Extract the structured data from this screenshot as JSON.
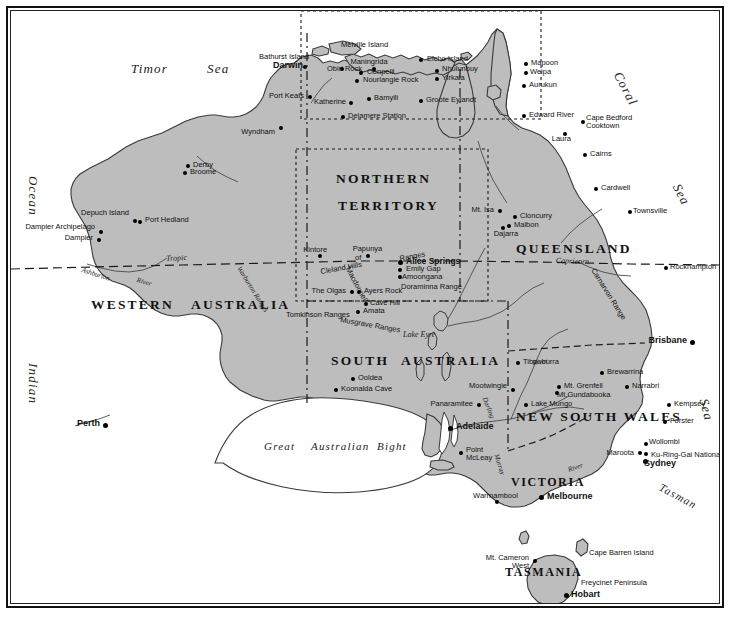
{
  "document": {
    "title": "Map of Australia",
    "caption": ""
  },
  "map": {
    "projection_note": "",
    "water_color": "#ffffff",
    "land_color": "#bdbdbd",
    "border_color": "#1a1a1a"
  },
  "oceans": [
    {
      "name": "Timor",
      "sub": "Sea"
    },
    {
      "name": "Indian",
      "sub": "Ocean"
    },
    {
      "name": "Coral",
      "sub": "Sea"
    },
    {
      "name": "Tasman",
      "sub": "Sea"
    }
  ],
  "ocean_labels": {
    "timor": "Timor",
    "timor_sea": "Sea",
    "ocean": "Ocean",
    "indian": "Indian",
    "coral": "Coral",
    "coral_sea": "Sea",
    "tasman": "Tasman",
    "tasman_sea": "Sea"
  },
  "states": {
    "northern": "NORTHERN",
    "territory": "TERRITORY",
    "queensland": "QUEENSLAND",
    "western": "WESTERN",
    "australia_w": "AUSTRALIA",
    "south": "SOUTH",
    "australia_s": "AUSTRALIA",
    "new_south_wales": "NEW  SOUTH  WALES",
    "victoria": "VICTORIA",
    "tasmania": "TASMANIA"
  },
  "features": {
    "tropic": "Tropic",
    "capricorn": "Capricorn",
    "great": "Great",
    "australian": "Australian",
    "bight": "Bight",
    "lake_eyre": "Lake Eyre",
    "ashburton": "Ashburton",
    "river_ash": "River",
    "warburton_ranges": "Warburton Ranges",
    "tomkinson_ranges": "Tomkinson Ranges",
    "musgrave_ranges": "Musgrave Ranges",
    "cleland_hills": "Cleland Hills",
    "macdonnell": "Macdonnell",
    "ranges_mac": "Ranges",
    "of_mac": "of",
    "doraminna_range": "Doraminna Range",
    "carnarvon_range": "Carnarvon Range",
    "darling_river": "Darling",
    "darling_river2": "River",
    "murray_river": "Murray",
    "murray_river2": "River",
    "murray_vic": "Murray",
    "river_vic": "River",
    "freycinet_peninsula": "Freycinet Peninsula",
    "cape_barren_island": "Cape Barren Island",
    "melville_island": "Melville Island",
    "bathurst_island": "Bathurst Island",
    "groote_eylandt": "Groote Eylandt",
    "elcho_island": "Elcho Island",
    "depuch_island": "Depuch Island",
    "dampier_archipelago": "Dampier Archipelago",
    "ku_ring_gai": "Ku-Ring-Gai National Park"
  },
  "places": [
    {
      "name": "Darwin",
      "bold": true
    },
    {
      "name": "Bathurst Island",
      "bold": false
    },
    {
      "name": "Melville Island",
      "bold": false
    },
    {
      "name": "Maningrida",
      "bold": false
    },
    {
      "name": "Oenpelli",
      "bold": false
    },
    {
      "name": "Obiri Rock",
      "bold": false
    },
    {
      "name": "Nourlangie Rock",
      "bold": false
    },
    {
      "name": "Elcho Island",
      "bold": false
    },
    {
      "name": "Nhulunbuy",
      "bold": false
    },
    {
      "name": "Yirkala",
      "bold": false
    },
    {
      "name": "Groote Eylandt",
      "bold": false
    },
    {
      "name": "Port Keats",
      "bold": false
    },
    {
      "name": "Katherine",
      "bold": false
    },
    {
      "name": "Bamyili",
      "bold": false
    },
    {
      "name": "Delamere Station",
      "bold": false
    },
    {
      "name": "Wyndham",
      "bold": false
    },
    {
      "name": "Derby",
      "bold": false
    },
    {
      "name": "Broome",
      "bold": false
    },
    {
      "name": "Depuch Island",
      "bold": false
    },
    {
      "name": "Port Hedland",
      "bold": false
    },
    {
      "name": "Dampier Archipelago",
      "bold": false
    },
    {
      "name": "Dampier",
      "bold": false
    },
    {
      "name": "Mapoon",
      "bold": false
    },
    {
      "name": "Weipa",
      "bold": false
    },
    {
      "name": "Aurukun",
      "bold": false
    },
    {
      "name": "Edward River",
      "bold": false
    },
    {
      "name": "Cape Bedford",
      "bold": false
    },
    {
      "name": "Cooktown",
      "bold": false
    },
    {
      "name": "Laura",
      "bold": false
    },
    {
      "name": "Cairns",
      "bold": false
    },
    {
      "name": "Cardwell",
      "bold": false
    },
    {
      "name": "Townsville",
      "bold": false
    },
    {
      "name": "Mt. Isa",
      "bold": false
    },
    {
      "name": "Cloncurry",
      "bold": false
    },
    {
      "name": "Malbon",
      "bold": false
    },
    {
      "name": "Dajarra",
      "bold": false
    },
    {
      "name": "Rockhampton",
      "bold": false
    },
    {
      "name": "Brisbane",
      "bold": true
    },
    {
      "name": "Kintore",
      "bold": false
    },
    {
      "name": "Papunya",
      "bold": false
    },
    {
      "name": "Alice Springs",
      "bold": true
    },
    {
      "name": "Emily Gap",
      "bold": false
    },
    {
      "name": "Amoongana",
      "bold": false
    },
    {
      "name": "The Olgas",
      "bold": false
    },
    {
      "name": "Ayers Rock",
      "bold": false
    },
    {
      "name": "Cave Hill",
      "bold": false
    },
    {
      "name": "Amata",
      "bold": false
    },
    {
      "name": "Ooldea",
      "bold": false
    },
    {
      "name": "Koonalda Cave",
      "bold": false
    },
    {
      "name": "Panaramitee",
      "bold": false
    },
    {
      "name": "Adelaide",
      "bold": true
    },
    {
      "name": "Point McLeay",
      "bold": false
    },
    {
      "name": "Perth",
      "bold": true
    },
    {
      "name": "Tibooburra",
      "bold": false
    },
    {
      "name": "Brewarrina",
      "bold": false
    },
    {
      "name": "Mootwingie",
      "bold": false
    },
    {
      "name": "Mt. Grenfell",
      "bold": false
    },
    {
      "name": "Mt. Gundabooka",
      "bold": false
    },
    {
      "name": "Narrabri",
      "bold": false
    },
    {
      "name": "Lake Mungo",
      "bold": false
    },
    {
      "name": "Kempsey",
      "bold": false
    },
    {
      "name": "Forster",
      "bold": false
    },
    {
      "name": "Wollombi",
      "bold": false
    },
    {
      "name": "Maroota",
      "bold": false
    },
    {
      "name": "Sydney",
      "bold": true
    },
    {
      "name": "Warrnambool",
      "bold": false
    },
    {
      "name": "Melbourne",
      "bold": true
    },
    {
      "name": "Mt. Cameron",
      "bold": false
    },
    {
      "name": "West",
      "bold": false
    },
    {
      "name": "Hobart",
      "bold": true
    }
  ],
  "place_labels": {
    "darwin": "Darwin",
    "bathurst_island": "Bathurst Island",
    "melville_island": "Melville Island",
    "maningrida": "Maningrida",
    "oenpelli": "Oenpelli",
    "obiri_rock": "Obiri Rock",
    "nourlangie_rock": "Nourlangie Rock",
    "elcho_island": "Elcho Island",
    "nhulunbuy": "Nhulunbuy",
    "yirkala": "Yirkala",
    "groote_eylandt": "Groote Eylandt",
    "port_keats": "Port Keats",
    "katherine": "Katherine",
    "bamyili": "Bamyili",
    "delamere_station": "Delamere Station",
    "wyndham": "Wyndham",
    "derby": "Derby",
    "broome": "Broome",
    "depuch_island": "Depuch Island",
    "port_hedland": "Port Hedland",
    "dampier_archipelago": "Dampier Archipelago",
    "dampier": "Dampier",
    "mapoon": "Mapoon",
    "weipa": "Weipa",
    "aurukun": "Aurukun",
    "edward_river": "Edward River",
    "cape_bedford": "Cape Bedford",
    "cooktown": "Cooktown",
    "laura": "Laura",
    "cairns": "Cairns",
    "cardwell": "Cardwell",
    "townsville": "Townsville",
    "mt_isa": "Mt. Isa",
    "cloncurry": "Cloncurry",
    "malbon": "Malbon",
    "dajarra": "Dajarra",
    "rockhampton": "Rockhampton",
    "brisbane": "Brisbane",
    "kintore": "Kintore",
    "papunya": "Papunya",
    "alice_springs": "Alice Springs",
    "emily_gap": "Emily Gap",
    "amoongana": "Amoongana",
    "the_olgas": "The Olgas",
    "ayers_rock": "Ayers Rock",
    "cave_hill": "Cave Hill",
    "amata": "Amata",
    "ooldea": "Ooldea",
    "koonalda_cave": "Koonalda Cave",
    "panaramitee": "Panaramitee",
    "adelaide": "Adelaide",
    "point_mcleay": "Point",
    "point_mcleay2": "McLeay",
    "perth": "Perth",
    "tibooburra": "Tibooburra",
    "brewarrina": "Brewarrina",
    "mootwingie": "Mootwingie",
    "mt_grenfell": "Mt. Grenfell",
    "mt_gundabooka": "Mt.Gundabooka",
    "narrabri": "Narrabri",
    "lake_mungo": "Lake Mungo",
    "kempsey": "Kempsey",
    "forster": "Forster",
    "wollombi": "Wollombi",
    "maroota": "Maroota",
    "ku_ring_gai": "Ku-Ring-Gai National Park",
    "sydney": "Sydney",
    "warrnambool": "Warrnambool",
    "melbourne": "Melbourne",
    "mt_cameron": "Mt. Cameron",
    "mt_cameron2": "West",
    "cape_barren_island": "Cape Barren Island",
    "freycinet_peninsula": "Freycinet Peninsula",
    "hobart": "Hobart"
  }
}
